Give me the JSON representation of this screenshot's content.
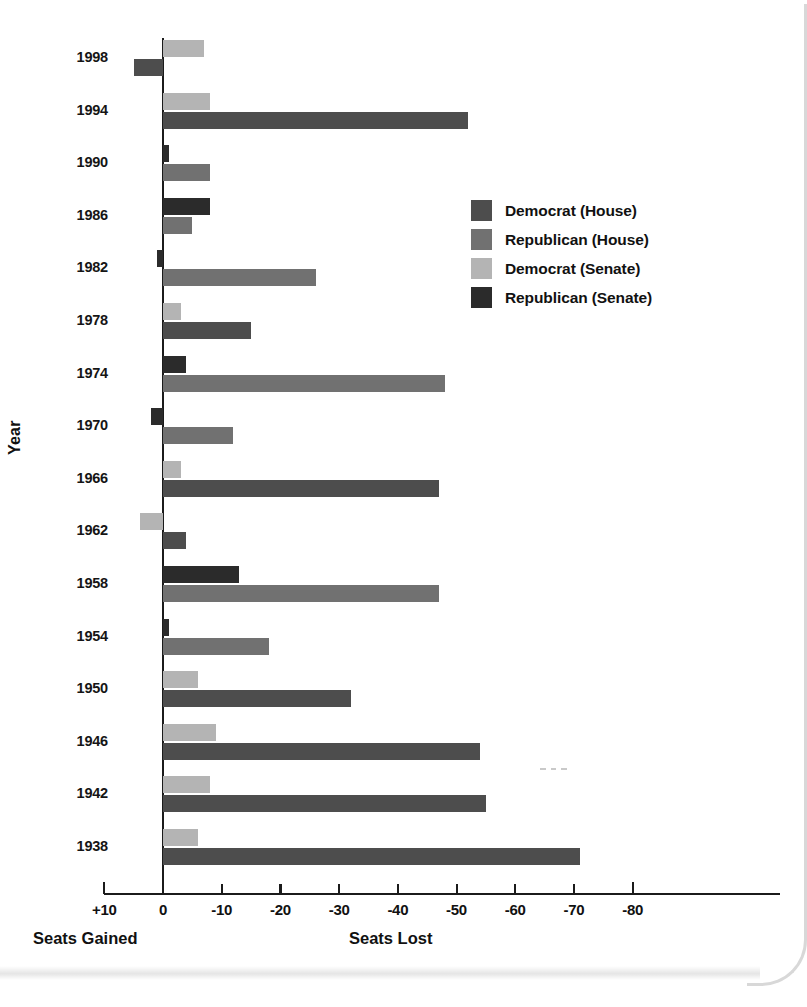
{
  "figure": {
    "ylabel": "Year",
    "left_caption": "Seats Gained",
    "right_caption": "Seats Lost"
  },
  "legend": {
    "position": "right-upper",
    "items": [
      {
        "label": "Democrat (House)",
        "color": "#4d4d4d"
      },
      {
        "label": "Republican (House)",
        "color": "#717171"
      },
      {
        "label": "Democrat (Senate)",
        "color": "#b4b4b4"
      },
      {
        "label": "Republican (Senate)",
        "color": "#2b2b2b"
      }
    ]
  },
  "chart_data": {
    "type": "bar",
    "orientation": "horizontal",
    "title": "",
    "xlabel": "Seats Lost",
    "ylabel": "Year",
    "xtick_labels": [
      "+10",
      "0",
      "-10",
      "-20",
      "-30",
      "-40",
      "-50",
      "-60",
      "-70",
      "-80"
    ],
    "xtick_values": [
      10,
      0,
      -10,
      -20,
      -30,
      -40,
      -50,
      -60,
      -70,
      -80
    ],
    "xlim": [
      10,
      -80
    ],
    "grid": false,
    "note": "Values are seat change for the president's party in midterm elections. Negative = seats lost, positive = seats gained.",
    "categories": [
      1998,
      1994,
      1990,
      1986,
      1982,
      1978,
      1974,
      1970,
      1966,
      1962,
      1958,
      1954,
      1950,
      1946,
      1942,
      1938
    ],
    "series": [
      {
        "name": "Democrat (House)",
        "color": "#4d4d4d",
        "values": [
          5,
          -52,
          null,
          null,
          null,
          -15,
          null,
          null,
          -47,
          -4,
          null,
          null,
          -32,
          -54,
          -55,
          -71
        ]
      },
      {
        "name": "Republican (House)",
        "color": "#717171",
        "values": [
          null,
          null,
          -8,
          -5,
          -26,
          null,
          -48,
          -12,
          null,
          null,
          -47,
          -18,
          null,
          null,
          null,
          null
        ]
      },
      {
        "name": "Democrat (Senate)",
        "color": "#b4b4b4",
        "values": [
          -7,
          -8,
          null,
          null,
          null,
          -3,
          null,
          null,
          -3,
          4,
          null,
          null,
          -6,
          -9,
          -8,
          -6
        ]
      },
      {
        "name": "Republican (Senate)",
        "color": "#2b2b2b",
        "values": [
          null,
          null,
          -1,
          -8,
          1,
          null,
          -4,
          2,
          null,
          null,
          -13,
          -1,
          null,
          null,
          null,
          null
        ]
      }
    ],
    "rows": [
      {
        "year": 1998,
        "upper": {
          "series": "Democrat (Senate)",
          "value": -7
        },
        "lower": {
          "series": "Democrat (House)",
          "value": 5
        }
      },
      {
        "year": 1994,
        "upper": {
          "series": "Democrat (Senate)",
          "value": -8
        },
        "lower": {
          "series": "Democrat (House)",
          "value": -52
        }
      },
      {
        "year": 1990,
        "upper": {
          "series": "Republican (Senate)",
          "value": -1
        },
        "lower": {
          "series": "Republican (House)",
          "value": -8
        }
      },
      {
        "year": 1986,
        "upper": {
          "series": "Republican (Senate)",
          "value": -8
        },
        "lower": {
          "series": "Republican (House)",
          "value": -5
        }
      },
      {
        "year": 1982,
        "upper": {
          "series": "Republican (Senate)",
          "value": 1
        },
        "lower": {
          "series": "Republican (House)",
          "value": -26
        }
      },
      {
        "year": 1978,
        "upper": {
          "series": "Democrat (Senate)",
          "value": -3
        },
        "lower": {
          "series": "Democrat (House)",
          "value": -15
        }
      },
      {
        "year": 1974,
        "upper": {
          "series": "Republican (Senate)",
          "value": -4
        },
        "lower": {
          "series": "Republican (House)",
          "value": -48
        }
      },
      {
        "year": 1970,
        "upper": {
          "series": "Republican (Senate)",
          "value": 2
        },
        "lower": {
          "series": "Republican (House)",
          "value": -12
        }
      },
      {
        "year": 1966,
        "upper": {
          "series": "Democrat (Senate)",
          "value": -3
        },
        "lower": {
          "series": "Democrat (House)",
          "value": -47
        }
      },
      {
        "year": 1962,
        "upper": {
          "series": "Democrat (Senate)",
          "value": 4
        },
        "lower": {
          "series": "Democrat (House)",
          "value": -4
        }
      },
      {
        "year": 1958,
        "upper": {
          "series": "Republican (Senate)",
          "value": -13
        },
        "lower": {
          "series": "Republican (House)",
          "value": -47
        }
      },
      {
        "year": 1954,
        "upper": {
          "series": "Republican (Senate)",
          "value": -1
        },
        "lower": {
          "series": "Republican (House)",
          "value": -18
        }
      },
      {
        "year": 1950,
        "upper": {
          "series": "Democrat (Senate)",
          "value": -6
        },
        "lower": {
          "series": "Democrat (House)",
          "value": -32
        }
      },
      {
        "year": 1946,
        "upper": {
          "series": "Democrat (Senate)",
          "value": -9
        },
        "lower": {
          "series": "Democrat (House)",
          "value": -54
        }
      },
      {
        "year": 1942,
        "upper": {
          "series": "Democrat (Senate)",
          "value": -8
        },
        "lower": {
          "series": "Democrat (House)",
          "value": -55
        }
      },
      {
        "year": 1938,
        "upper": {
          "series": "Democrat (Senate)",
          "value": -6
        },
        "lower": {
          "series": "Democrat (House)",
          "value": -71
        }
      }
    ]
  },
  "geometry": {
    "zero_x": 163,
    "px_per_seat": 5.87,
    "row_top": 40,
    "row_pitch": 52.6,
    "bar_height": 17,
    "bar_gap": 2
  }
}
